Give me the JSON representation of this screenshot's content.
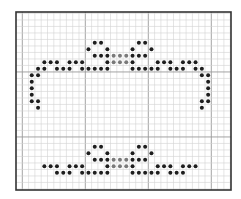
{
  "pattern": {
    "type": "dot-grid-pattern",
    "frame": {
      "x": 16,
      "y": 12,
      "width": 215,
      "height": 178
    },
    "cell": {
      "w": 6.3,
      "h": 6.5
    },
    "col_origin_x": 16,
    "row_origin_y": 10.2,
    "major_every": 10,
    "major_col_offset": 1,
    "colors": {
      "background": "#ffffff",
      "grid_minor": "#d4d4d4",
      "grid_major": "#9a9a9a",
      "border": "#333333",
      "dot_dark": "#1e1e1e",
      "dot_gray": "#7a7a7a"
    },
    "dot_radius": 2.0,
    "rows": [
      {
        "r": 5,
        "dark": [
          12,
          13,
          19,
          20
        ],
        "gray": []
      },
      {
        "r": 6,
        "dark": [
          11,
          14,
          18,
          21
        ],
        "gray": []
      },
      {
        "r": 7,
        "dark": [
          12,
          13,
          14,
          18,
          19,
          20
        ],
        "gray": [
          15,
          16,
          17
        ]
      },
      {
        "r": 8,
        "dark": [
          4,
          5,
          6,
          8,
          9,
          10,
          14,
          18,
          22,
          23,
          24,
          26,
          27,
          28
        ],
        "gray": [
          15,
          16,
          17
        ]
      },
      {
        "r": 9,
        "dark": [
          3,
          4,
          6,
          7,
          8,
          10,
          11,
          12,
          13,
          14,
          18,
          19,
          20,
          21,
          22,
          24,
          25,
          26,
          28,
          29
        ],
        "gray": []
      },
      {
        "r": 10,
        "dark": [
          2,
          3,
          29,
          30
        ],
        "gray": []
      },
      {
        "r": 11,
        "dark": [
          2,
          30
        ],
        "gray": []
      },
      {
        "r": 12,
        "dark": [
          2,
          30
        ],
        "gray": []
      },
      {
        "r": 13,
        "dark": [
          2,
          30
        ],
        "gray": []
      },
      {
        "r": 14,
        "dark": [
          2,
          3,
          29,
          30
        ],
        "gray": []
      },
      {
        "r": 15,
        "dark": [
          3,
          29
        ],
        "gray": []
      },
      {
        "r": 21,
        "dark": [
          12,
          13,
          19,
          20
        ],
        "gray": []
      },
      {
        "r": 22,
        "dark": [
          11,
          14,
          18,
          21
        ],
        "gray": []
      },
      {
        "r": 23,
        "dark": [
          12,
          13,
          14,
          18,
          19,
          20
        ],
        "gray": [
          15,
          16,
          17
        ]
      },
      {
        "r": 24,
        "dark": [
          4,
          5,
          6,
          8,
          9,
          10,
          14,
          18,
          22,
          23,
          24,
          26,
          27,
          28
        ],
        "gray": [
          15,
          16,
          17
        ]
      },
      {
        "r": 25,
        "dark": [
          6,
          7,
          8,
          10,
          11,
          12,
          13,
          14,
          18,
          19,
          20,
          21,
          22,
          24,
          25,
          26
        ],
        "gray": []
      }
    ]
  }
}
